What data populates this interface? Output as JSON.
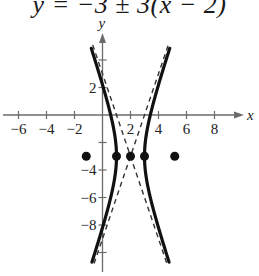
{
  "chart_data": {
    "type": "line",
    "title": "y = −3 ± 3(x − 2)",
    "xlabel": "x",
    "ylabel": "y",
    "xlim": [
      -7,
      10
    ],
    "ylim": [
      -11,
      5.5
    ],
    "x_ticks": [
      -6,
      -4,
      -2,
      2,
      4,
      6,
      8
    ],
    "x_tick_labels": [
      "−6",
      "−4",
      "−2",
      "2",
      "4",
      "6",
      "8"
    ],
    "y_ticks": [
      4,
      2,
      -2,
      -4,
      -6,
      -8,
      -10
    ],
    "y_tick_labels": [
      "",
      "2",
      "",
      "−4",
      "−6",
      "−8",
      ""
    ],
    "grid": false,
    "series": [
      {
        "name": "hyperbola (x−2)² − (y+3)²/9 = 1",
        "style": "solid-thick",
        "equation": "(x-2)^2 - (y+3)^2/9 = 1",
        "center": [
          2,
          -3
        ],
        "a": 1,
        "b": 3,
        "y_range": [
          -10.7,
          4.85
        ]
      },
      {
        "name": "asymptote y = −3 + 3(x − 2)",
        "style": "dashed",
        "slope": 3,
        "through": [
          2,
          -3
        ],
        "x_range": [
          -0.6,
          4.7
        ]
      },
      {
        "name": "asymptote y = −3 − 3(x − 2)",
        "style": "dashed",
        "slope": -3,
        "through": [
          2,
          -3
        ],
        "x_range": [
          -0.7,
          4.6
        ]
      }
    ],
    "points": [
      {
        "label": "focus",
        "x": -1.16,
        "y": -3
      },
      {
        "label": "vertex",
        "x": 1,
        "y": -3
      },
      {
        "label": "center",
        "x": 2,
        "y": -3
      },
      {
        "label": "vertex",
        "x": 3,
        "y": -3
      },
      {
        "label": "focus",
        "x": 5.16,
        "y": -3
      }
    ]
  },
  "layout": {
    "origin_px": [
      102.5,
      115
    ],
    "px_per_unit_x": 14,
    "px_per_unit_y": 13.75,
    "x_axis_px": [
      3,
      244
    ],
    "y_axis_px": [
      272,
      33
    ]
  },
  "colors": {
    "curve": "#111111",
    "axis": "#6b6b6b",
    "asymptote": "#333333",
    "points": "#111111"
  }
}
